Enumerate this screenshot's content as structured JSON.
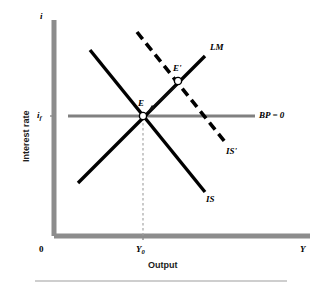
{
  "figure": {
    "kind": "is-lm-bp-diagram",
    "background": "#ffffff",
    "axis_color": "#808080",
    "curve_color": "#000000",
    "bp_color": "#808080",
    "guide_color": "#9e9e9e",
    "width": 322,
    "height": 286
  },
  "axes": {
    "y_axis_symbol": "i",
    "y_axis_title": "Interest rate",
    "x_axis_symbol": "Y",
    "x_axis_title": "Output",
    "origin_label": "0",
    "y_tick_label": "i",
    "y_tick_subscript": "f",
    "x_tick_label": "Y",
    "x_tick_subscript": "0"
  },
  "curves": [
    {
      "name": "LM",
      "label": "LM",
      "style": "solid",
      "slope": "upward",
      "color": "#000000",
      "label_x": 210,
      "label_y": 48,
      "x1": 78,
      "y1": 183,
      "x2": 205,
      "y2": 56
    },
    {
      "name": "IS",
      "label": "IS",
      "style": "solid",
      "slope": "downward",
      "color": "#000000",
      "label_x": 213,
      "label_y": 200,
      "x1": 90,
      "y1": 50,
      "x2": 205,
      "y2": 192
    },
    {
      "name": "IS-prime",
      "label": "IS'",
      "style": "dashed",
      "slope": "downward",
      "color": "#000000",
      "label_x": 233,
      "label_y": 152,
      "x1": 137,
      "y1": 32,
      "x2": 225,
      "y2": 142
    },
    {
      "name": "BP",
      "label": "BP = 0",
      "style": "solid",
      "slope": "horizontal",
      "color": "#808080",
      "label_x": 260,
      "label_y": 116,
      "x1": 68,
      "y1": 116,
      "x2": 255,
      "y2": 116
    }
  ],
  "points": [
    {
      "name": "E",
      "label": "E",
      "x": 143,
      "y": 116,
      "label_x": 139,
      "label_y": 104
    },
    {
      "name": "E-prime",
      "label": "E'",
      "x": 178,
      "y": 81,
      "label_x": 174,
      "label_y": 69
    }
  ],
  "annotations": [
    {
      "name": "adjustment-arrow",
      "from_x": 176,
      "from_y": 86,
      "to_x": 148,
      "to_y": 112
    }
  ],
  "guides": [
    {
      "name": "y0-dropline",
      "x": 143,
      "y_top": 116,
      "y_bottom": 236,
      "style": "dashed"
    }
  ],
  "footer_rule": {
    "x1": 35,
    "x2": 287,
    "y": 281,
    "color": "#9e9e9e"
  }
}
